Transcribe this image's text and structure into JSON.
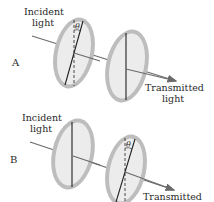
{
  "panels": [
    {
      "id": "A",
      "label": "A",
      "incident_label_line1": "Incident",
      "incident_label_line2": "light",
      "transmitted_label_line1": "Transmitted",
      "transmitted_label_line2": "light",
      "angle_symbol": "θ",
      "tilted_polarizer": "first"
    },
    {
      "id": "B",
      "label": "B",
      "incident_label_line1": "Incident",
      "incident_label_line2": "light",
      "transmitted_label_line1": "Transmitted",
      "angle_symbol": "θ",
      "tilted_polarizer": "second"
    }
  ],
  "colors": {
    "ring": "#bdbdbd",
    "disc": "#ececec",
    "line": "#222222",
    "arrow": "#6a6a6a"
  }
}
